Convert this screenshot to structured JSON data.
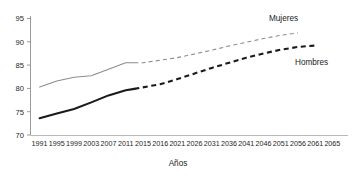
{
  "chart_data": {
    "type": "line",
    "title": "",
    "xlabel": "Años",
    "ylabel": "",
    "xlim": [
      1991,
      2065
    ],
    "ylim": [
      70,
      95
    ],
    "grid": false,
    "legend_position": "inline-right",
    "x_tick_labels": [
      "1991",
      "1995",
      "1999",
      "2003",
      "2007",
      "2011",
      "2015",
      "2016",
      "2021",
      "2026",
      "2031",
      "2036",
      "2041",
      "2046",
      "2051",
      "2056",
      "2061",
      "2065"
    ],
    "y_tick_labels": [
      "70",
      "75",
      "80",
      "85",
      "90",
      "95"
    ],
    "y_ticks": [
      70,
      75,
      80,
      85,
      90,
      95
    ],
    "series": [
      {
        "name": "Mujeres",
        "label": "Mujeres",
        "color": "#8c8c8c",
        "style_observed": "solid",
        "style_projected": "dashed",
        "observed": {
          "x": [
            1991,
            1995,
            1999,
            2003,
            2007,
            2011,
            2013
          ],
          "values": [
            80.3,
            81.6,
            82.4,
            82.7,
            84.1,
            85.5,
            85.5
          ]
        },
        "projected": {
          "x": [
            2013,
            2015,
            2021,
            2026,
            2031,
            2036,
            2041,
            2046,
            2051,
            2056
          ],
          "values": [
            85.5,
            85.5,
            86.6,
            87.4,
            88.2,
            89.1,
            89.9,
            90.7,
            91.4,
            91.9
          ]
        }
      },
      {
        "name": "Hombres",
        "label": "Hombres",
        "color": "#1a1a1a",
        "style_observed": "solid",
        "style_projected": "dashed",
        "observed": {
          "x": [
            1991,
            1995,
            1999,
            2003,
            2007,
            2011,
            2013
          ],
          "values": [
            73.6,
            74.6,
            75.6,
            77.0,
            78.5,
            79.6,
            79.9
          ]
        },
        "projected": {
          "x": [
            2013,
            2016,
            2021,
            2026,
            2031,
            2036,
            2041,
            2046,
            2051,
            2056,
            2061
          ],
          "values": [
            79.9,
            80.9,
            82.0,
            83.2,
            84.4,
            85.5,
            86.6,
            87.5,
            88.3,
            88.9,
            89.2
          ]
        }
      }
    ]
  },
  "labels": {
    "x_axis_title": "Años",
    "series_mujeres": "Mujeres",
    "series_hombres": "Hombres"
  },
  "colors": {
    "mujeres": "#8c8c8c",
    "hombres": "#1a1a1a",
    "axis": "#9a9a9a",
    "background": "#ffffff"
  }
}
